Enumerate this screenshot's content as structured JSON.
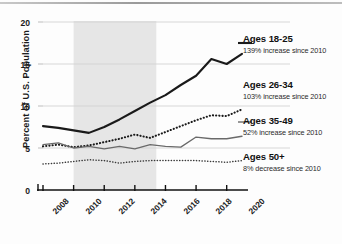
{
  "chart_data": {
    "type": "line",
    "title": "",
    "xlabel": "",
    "ylabel": "Percent of U.S. Population",
    "xlim": [
      2008,
      2021
    ],
    "ylim": [
      0,
      20
    ],
    "grid": "horizontal",
    "legend_position": "right",
    "y_ticks": [
      "0",
      "5",
      "10",
      "15",
      "20"
    ],
    "y_tick_values": [
      0,
      5,
      10,
      15,
      20
    ],
    "x_ticks": [
      "2008",
      "2010",
      "2012",
      "2014",
      "2016",
      "2018",
      "2020"
    ],
    "x_tick_values": [
      2008,
      2010,
      2012,
      2014,
      2016,
      2018,
      2020
    ],
    "shaded_region": {
      "start": 2010,
      "end": 2015.4,
      "color": "#e6e6e6"
    },
    "x": [
      2008,
      2009,
      2010,
      2011,
      2012,
      2013,
      2014,
      2015,
      2016,
      2017,
      2018,
      2019,
      2020,
      2021
    ],
    "series": [
      {
        "name": "Ages 18-25",
        "style": "solid-thick",
        "color": "#1a1a1a",
        "annotation": "139% increase since 2010",
        "values": [
          7.6,
          7.4,
          7.1,
          6.8,
          7.5,
          8.4,
          9.4,
          10.4,
          11.3,
          12.5,
          13.6,
          15.6,
          15.0,
          16.2
        ]
      },
      {
        "name": "Ages 26-34",
        "style": "dotted-thick",
        "color": "#1a1a1a",
        "annotation": "103% increase since 2010",
        "values": [
          5.2,
          5.4,
          5.1,
          5.3,
          5.7,
          6.1,
          6.6,
          6.2,
          6.9,
          7.6,
          8.3,
          8.9,
          8.8,
          9.6
        ]
      },
      {
        "name": "Ages 35-49",
        "style": "solid-thin",
        "color": "#6a6a6a",
        "annotation": "52% increase since 2010",
        "values": [
          5.4,
          5.6,
          5.0,
          5.2,
          4.9,
          5.2,
          4.9,
          5.4,
          5.2,
          5.1,
          6.3,
          6.1,
          6.1,
          6.4
        ]
      },
      {
        "name": "Ages 50+",
        "style": "dotted-thin",
        "color": "#3a3a3a",
        "annotation": "8% decrease since 2010",
        "values": [
          3.1,
          3.2,
          3.4,
          3.6,
          3.5,
          3.2,
          3.4,
          3.5,
          3.5,
          3.5,
          3.5,
          3.4,
          3.3,
          3.5
        ]
      }
    ]
  },
  "axis": {
    "y_label": "Percent of U.S. Population",
    "y_ticks": [
      "20",
      "15",
      "10",
      "5",
      "0"
    ],
    "x_ticks": [
      "2008",
      "2010",
      "2012",
      "2014",
      "2016",
      "2018",
      "2020"
    ]
  },
  "legend": [
    {
      "title": "Ages 18-25",
      "sub": "139% increase since 2010"
    },
    {
      "title": "Ages 26-34",
      "sub": "103% increase since 2010"
    },
    {
      "title": "Ages 35-49",
      "sub": "52% increase since 2010"
    },
    {
      "title": "Ages 50+",
      "sub": "8% decrease since 2010"
    }
  ]
}
